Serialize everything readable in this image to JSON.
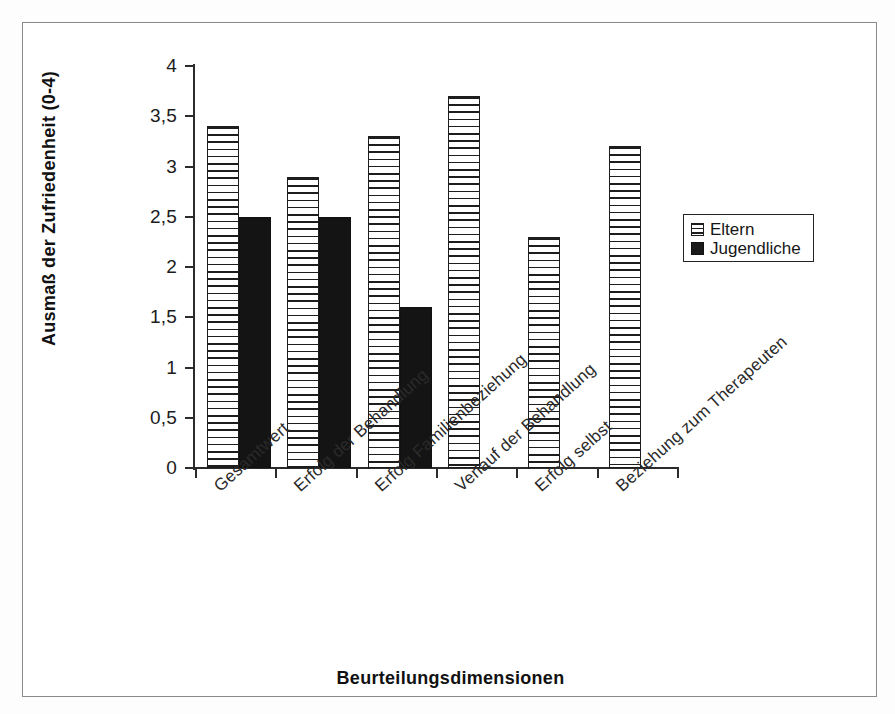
{
  "chart_data": {
    "type": "bar",
    "title": "",
    "xlabel": "Beurteilungsdimensionen",
    "ylabel": "Ausmaß der Zufriedenheit (0-4)",
    "ylim": [
      0,
      4
    ],
    "ytick_labels": [
      "4",
      "3,5",
      "3",
      "2,5",
      "2",
      "1,5",
      "1",
      "0,5",
      "0"
    ],
    "ytick_values": [
      4,
      3.5,
      3,
      2.5,
      2,
      1.5,
      1,
      0.5,
      0
    ],
    "grid": false,
    "legend_position": "right",
    "categories": [
      "Gesamtwert",
      "Erfolg der Behandlung",
      "Erfolg Familienbeziehung",
      "Verlauf der Behandlung",
      "Erfolg selbst",
      "Beziehung zum Therapeuten"
    ],
    "series": [
      {
        "name": "Eltern",
        "pattern": "horizontal-stripes",
        "values": [
          3.4,
          2.9,
          3.3,
          3.7,
          2.3,
          3.2
        ]
      },
      {
        "name": "Jugendliche",
        "pattern": "solid-black",
        "values": [
          2.5,
          2.5,
          1.6,
          null,
          null,
          null
        ]
      }
    ]
  },
  "legend": {
    "entries": [
      {
        "label": "Eltern",
        "swatch": "striped-swatch-icon"
      },
      {
        "label": "Jugendliche",
        "swatch": "black-swatch-icon"
      }
    ]
  },
  "axes": {
    "y_title": "Ausmaß der Zufriedenheit (0-4)",
    "x_title": "Beurteilungsdimensionen"
  },
  "colors": {
    "ink": "#1d1d1d",
    "axis": "#2b2b2b",
    "frame": "#8a8a8a",
    "background": "#ffffff",
    "series_eltern": "#ffffff",
    "series_jugendliche": "#141414"
  }
}
